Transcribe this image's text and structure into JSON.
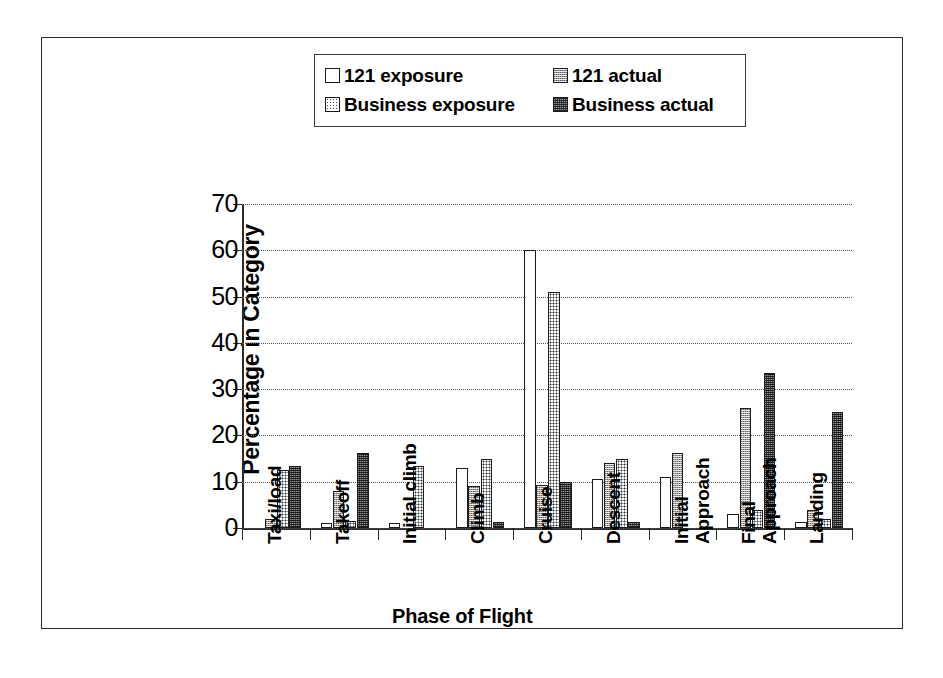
{
  "chart_data": {
    "type": "bar",
    "title": "",
    "xlabel": "Phase of Flight",
    "ylabel": "Percentage in Category",
    "ylim": [
      0,
      70
    ],
    "yticks": [
      0,
      10,
      20,
      30,
      40,
      50,
      60,
      70
    ],
    "grid": true,
    "legend_position": "top-center",
    "categories": [
      "Taxi/load",
      "Takeoff",
      "Initial climb",
      "Climb",
      "Cruise",
      "Descent",
      "Initial Approach",
      "Final Approach",
      "Landing"
    ],
    "category_lines": [
      [
        "Taxi/load"
      ],
      [
        "Takeoff"
      ],
      [
        "Initial climb"
      ],
      [
        "Climb"
      ],
      [
        "Cruise"
      ],
      [
        "Descent"
      ],
      [
        "Initial",
        "Approach"
      ],
      [
        "Final",
        "Approach"
      ],
      [
        "Landing"
      ]
    ],
    "series": [
      {
        "name": "121 exposure",
        "pattern": "white",
        "values": [
          0,
          1.0,
          1.0,
          13.0,
          60.0,
          10.5,
          11.0,
          3.0,
          1.3
        ]
      },
      {
        "name": "121 actual",
        "pattern": "gray",
        "values": [
          2.0,
          8.0,
          0,
          9.0,
          9.3,
          14.0,
          16.3,
          26.0,
          4.0
        ]
      },
      {
        "name": "Business exposure",
        "pattern": "dot",
        "values": [
          12.5,
          1.5,
          13.5,
          15.0,
          51.0,
          15.0,
          0,
          4.0,
          2.0
        ]
      },
      {
        "name": "Business actual",
        "pattern": "dark",
        "values": [
          13.5,
          16.2,
          0,
          1.3,
          10.0,
          1.3,
          0,
          33.5,
          25.0
        ]
      }
    ]
  },
  "legend": {
    "items": [
      {
        "label": "121 exposure",
        "swatch": "legend-swatch-white"
      },
      {
        "label": "121 actual",
        "swatch": "legend-swatch-gray"
      },
      {
        "label": "Business exposure",
        "swatch": "legend-swatch-dotted"
      },
      {
        "label": "Business actual",
        "swatch": "legend-swatch-dark"
      }
    ]
  }
}
